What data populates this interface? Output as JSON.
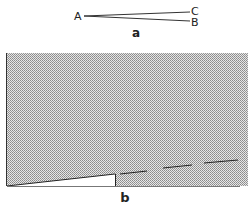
{
  "figure_a": {
    "caption": "a",
    "points": {
      "A": "A",
      "B": "B",
      "C": "C"
    }
  },
  "figure_b": {
    "caption": "b"
  },
  "colors": {
    "ink": "#222222",
    "shade": "#bdbdbd",
    "background": "#ffffff"
  }
}
